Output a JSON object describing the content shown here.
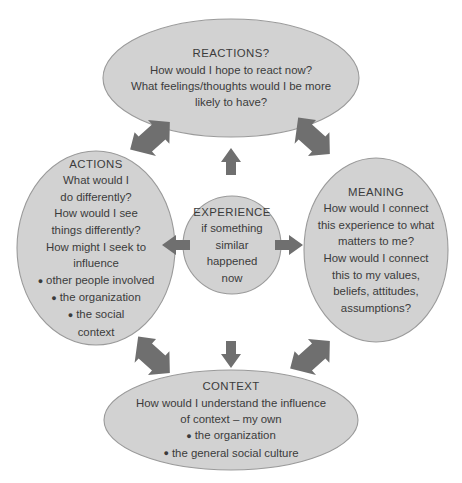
{
  "diagram": {
    "type": "reflective-cycle",
    "colors": {
      "node_fill": "#d2d2d2",
      "node_stroke": "#9a9a9a",
      "arrow": "#6f6f6f",
      "text": "#3b3b3b",
      "background": "#ffffff"
    },
    "nodes": {
      "reactions": {
        "id": "reactions",
        "shape": "ellipse",
        "title": "REACTIONS?",
        "lines": [
          "How would I hope to react now?",
          "What feelings/thoughts would I be more",
          "likely to have?"
        ],
        "bullets": []
      },
      "actions": {
        "id": "actions",
        "shape": "ellipse",
        "title": "ACTIONS",
        "lines": [
          "What would I",
          "do differently?",
          "How would I see",
          "things differently?",
          "How might I seek to",
          "influence"
        ],
        "bullets": [
          "other people involved",
          "the organization",
          "the social"
        ],
        "bullet_tail": "context"
      },
      "meaning": {
        "id": "meaning",
        "shape": "ellipse",
        "title": "MEANING",
        "lines": [
          "How would I connect",
          "this experience to what",
          "matters to me?",
          "How would I connect",
          "this to my values,",
          "beliefs, attitudes,",
          "assumptions?"
        ],
        "bullets": []
      },
      "experience": {
        "id": "experience",
        "shape": "circle",
        "title": "EXPERIENCE",
        "lines": [
          "if something",
          "similar",
          "happened",
          "now"
        ],
        "bullets": []
      },
      "context": {
        "id": "context",
        "shape": "ellipse",
        "title": "CONTEXT",
        "lines": [
          "How would I understand the influence",
          "of context – my own"
        ],
        "bullets": [
          "the organization",
          "the general social culture"
        ]
      }
    },
    "connectors": [
      {
        "id": "experience-to-reactions",
        "from": "experience",
        "to": "reactions",
        "direction": "up",
        "heads": 1
      },
      {
        "id": "experience-to-context",
        "from": "experience",
        "to": "context",
        "direction": "down",
        "heads": 1
      },
      {
        "id": "experience-to-actions",
        "from": "experience",
        "to": "actions",
        "direction": "left",
        "heads": 1
      },
      {
        "id": "experience-to-meaning",
        "from": "experience",
        "to": "meaning",
        "direction": "right",
        "heads": 1
      },
      {
        "id": "actions-reactions",
        "from": "actions",
        "to": "reactions",
        "direction": "diagonal-up-right",
        "heads": 2
      },
      {
        "id": "reactions-meaning",
        "from": "reactions",
        "to": "meaning",
        "direction": "diagonal-down-right",
        "heads": 2
      },
      {
        "id": "actions-context",
        "from": "actions",
        "to": "context",
        "direction": "diagonal-down-right",
        "heads": 2
      },
      {
        "id": "context-meaning",
        "from": "context",
        "to": "meaning",
        "direction": "diagonal-up-right",
        "heads": 2
      }
    ]
  }
}
